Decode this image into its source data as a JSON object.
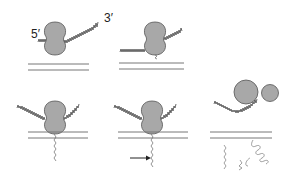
{
  "diagram": {
    "labels": {
      "five_prime": "5′",
      "three_prime": "3′"
    },
    "colors": {
      "ribosome_fill": "#a8a8a8",
      "ribosome_stroke": "#555555",
      "membrane": "#777777",
      "mrna": "#444444",
      "peptide": "#666666",
      "arrow": "#222222"
    },
    "panels": [
      {
        "id": 1,
        "position": "top-left",
        "state": "ribosome translating mRNA, free in cytosol"
      },
      {
        "id": 2,
        "position": "top-middle",
        "state": "ribosome approaching membrane, nascent peptide emerging"
      },
      {
        "id": 3,
        "position": "bottom-left",
        "state": "ribosome docked on membrane, peptide inserting"
      },
      {
        "id": 4,
        "position": "bottom-middle",
        "state": "peptide translocating; arrow marks signal peptide cleavage"
      },
      {
        "id": 5,
        "position": "bottom-right",
        "state": "ribosome subunits released; cleaved signal peptide and folded protein in lumen"
      }
    ]
  }
}
